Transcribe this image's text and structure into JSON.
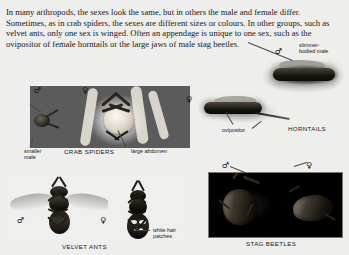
{
  "page": {
    "background_color": "#eeeeec",
    "body_text": "In many arthropods, the sexes look the same, but in others the male and female differ. Sometimes, as in crab spiders, the sexes are different sizes or colours. In other groups, such as velvet ants, only one sex is winged. Often an appendage is unique to one sex, such as the ovipositor of female horntails or the large jaws of male stag beetles."
  },
  "symbols": {
    "male": "♂",
    "female": "♀"
  },
  "figures": [
    {
      "id": "crab-spiders",
      "caption": "CRAB SPIDERS",
      "labels": [
        {
          "text": "smaller male"
        },
        {
          "text": "large abdomen"
        }
      ],
      "sex_markers": [
        "♂",
        "♀"
      ]
    },
    {
      "id": "horntails",
      "caption": "HORNTAILS",
      "labels": [
        {
          "text": "slimmer-bodied male"
        },
        {
          "text": "ovipositor"
        }
      ],
      "sex_markers": [
        "♂",
        "♀"
      ]
    },
    {
      "id": "velvet-ants",
      "caption": "VELVET ANTS",
      "labels": [
        {
          "text": "white hair patches"
        }
      ],
      "sex_markers": [
        "♂",
        "♀"
      ]
    },
    {
      "id": "stag-beetles",
      "caption": "STAG BEETLES",
      "labels": [],
      "sex_markers": [
        "♂",
        "♀"
      ]
    }
  ],
  "captions": {
    "crab_spiders": "CRAB SPIDERS",
    "horntails": "HORNTAILS",
    "velvet_ants": "VELVET ANTS",
    "stag_beetles": "STAG BEETLES"
  },
  "labels": {
    "smaller_male_line1": "smaller",
    "smaller_male_line2": "male",
    "large_abdomen": "large abdomen",
    "slimmer_male_line1": "slimmer-",
    "slimmer_male_line2": "bodied male",
    "ovipositor": "ovipositor",
    "white_hair_line1": "white hair",
    "white_hair_line2": "patches"
  }
}
